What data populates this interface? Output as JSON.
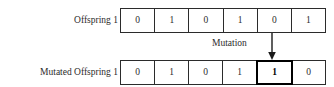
{
  "diagram": {
    "rows": [
      {
        "id": "offspring",
        "label": "Offspring 1",
        "cells": [
          {
            "value": "0",
            "mutated": false
          },
          {
            "value": "1",
            "mutated": false
          },
          {
            "value": "0",
            "mutated": false
          },
          {
            "value": "1",
            "mutated": false
          },
          {
            "value": "0",
            "mutated": false
          },
          {
            "value": "1",
            "mutated": false
          }
        ]
      },
      {
        "id": "mutated-offspring",
        "label": "Mutated Offspring 1",
        "cells": [
          {
            "value": "0",
            "mutated": false
          },
          {
            "value": "1",
            "mutated": false
          },
          {
            "value": "0",
            "mutated": false
          },
          {
            "value": "1",
            "mutated": false
          },
          {
            "value": "1",
            "mutated": true
          },
          {
            "value": "0",
            "mutated": false
          }
        ]
      }
    ],
    "annotation": {
      "label": "Mutation",
      "arrow_icon": "arrow-down-icon",
      "target_gene_index": 5
    },
    "colors": {
      "ink": "#2b2b2b",
      "emphasis": "#000000",
      "background": "#ffffff"
    }
  }
}
